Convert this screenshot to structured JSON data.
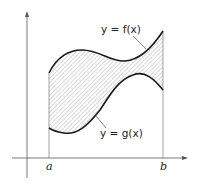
{
  "diagram": {
    "type": "area-between-curves",
    "curves": {
      "upper": {
        "label": "y = f(x)"
      },
      "lower": {
        "label": "y = g(x)"
      }
    },
    "x_axis": {
      "ticks": [
        "a",
        "b"
      ]
    },
    "region": {
      "fill": "hatched",
      "between": [
        "f(x)",
        "g(x)"
      ],
      "from": "a",
      "to": "b"
    },
    "colors": {
      "line": "#1a1a1a",
      "hatch": "#9a9a9a",
      "axis": "#555555"
    }
  }
}
